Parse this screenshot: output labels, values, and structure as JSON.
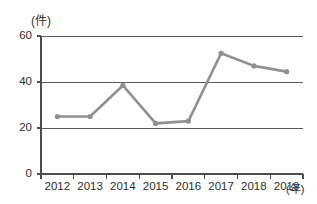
{
  "chart_data": {
    "type": "line",
    "title": "",
    "subtitle": "",
    "xlabel": "(年)",
    "ylabel": "(件)",
    "categories": [
      "2012",
      "2013",
      "2014",
      "2015",
      "2016",
      "2017",
      "2018",
      "2019"
    ],
    "values": [
      25,
      25,
      38.5,
      22,
      23,
      52.5,
      47,
      44.5
    ],
    "series": [
      {
        "name": "件数",
        "values": [
          25,
          25,
          38.5,
          22,
          23,
          52.5,
          47,
          44.5
        ]
      }
    ],
    "ylim": [
      0,
      60
    ],
    "y_ticks": [
      "0",
      "20",
      "40",
      "60"
    ],
    "y_tick_values": [
      0,
      20,
      40,
      60
    ],
    "x_ticks": [
      "2012",
      "2013",
      "2014",
      "2015",
      "2016",
      "2017",
      "2018",
      "2019"
    ],
    "grid": true,
    "grid_axis": "y",
    "legend": "none",
    "legend_position": "none",
    "line_color": "#8f9092",
    "marker_color": "#8f9092",
    "axis_color": "#4d4d4d",
    "grid_color": "#5a5a5a",
    "marker": "circle",
    "annotations": []
  },
  "axis": {
    "y_unit": "(件)",
    "x_unit": "(年)"
  }
}
